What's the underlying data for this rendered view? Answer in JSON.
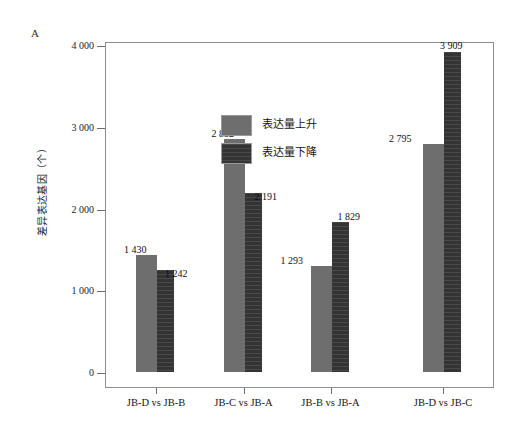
{
  "figure": {
    "panel_label": "A"
  },
  "chart_data": {
    "type": "bar",
    "title": "",
    "subtitle": "",
    "xlabel": "",
    "ylabel": "差异表达基因（个）",
    "ylim": [
      0,
      4000
    ],
    "ytick_labels": [
      "0",
      "1 000",
      "2 000",
      "3 000",
      "4 000"
    ],
    "ytick_values": [
      0,
      1000,
      2000,
      3000,
      4000
    ],
    "grid": false,
    "legend_position": "upper-left-inside",
    "categories": [
      "JB-D vs JB-B",
      "JB-C vs JB-A",
      "JB-B vs JB-A",
      "JB-D vs JB-C"
    ],
    "series": [
      {
        "name": "表达量上升",
        "color": "#6e6e6e",
        "values": [
          1430,
          2852,
          1293,
          2795
        ],
        "labels": [
          "1 430",
          "2 852",
          "1 293",
          "2 795"
        ]
      },
      {
        "name": "表达量下降",
        "color": "#343434",
        "values": [
          1242,
          2191,
          1829,
          3909
        ],
        "labels": [
          "1 242",
          "2 191",
          "1 829",
          "3 909"
        ]
      }
    ]
  }
}
